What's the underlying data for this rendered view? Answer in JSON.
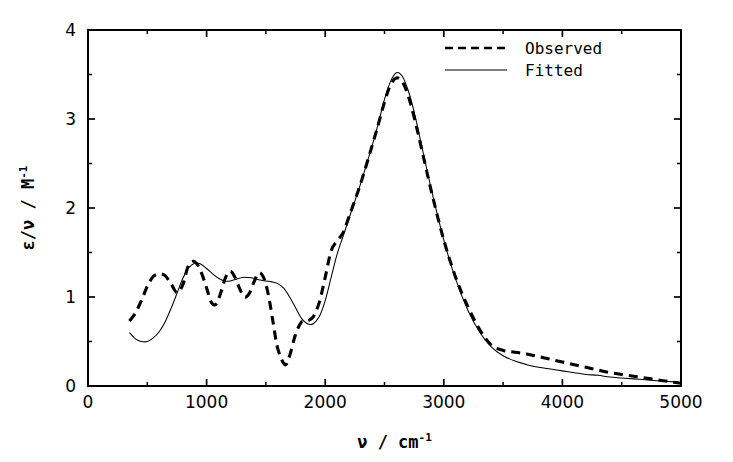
{
  "chart_data": {
    "type": "line",
    "title": "",
    "xlabel": "ν / cm⁻¹",
    "xlabel_parts": {
      "symbol": "ν",
      "separator": "/",
      "unit": "cm",
      "unit_exponent": "-1"
    },
    "ylabel": "ε/ν / M⁻¹",
    "ylabel_parts": {
      "symbol": "ε/ν",
      "separator": "/",
      "unit": "M",
      "unit_exponent": "-1"
    },
    "xlim": [
      0,
      5000
    ],
    "ylim": [
      0,
      4
    ],
    "xticks": [
      0,
      1000,
      2000,
      3000,
      4000,
      5000
    ],
    "xticklabels": [
      "0",
      "1000",
      "2000",
      "3000",
      "4000",
      "5000"
    ],
    "xminorticks": [
      500,
      1500,
      2500,
      3500,
      4500
    ],
    "yticks": [
      0,
      1,
      2,
      3,
      4
    ],
    "yticklabels": [
      "0",
      "1",
      "2",
      "3",
      "4"
    ],
    "yminorticks": [
      0.5,
      1.5,
      2.5,
      3.5
    ],
    "grid": false,
    "legend_position": "top-right",
    "legend": [
      {
        "name": "Observed",
        "style": "dashed",
        "width": "thick"
      },
      {
        "name": "Fitted",
        "style": "solid",
        "width": "thin"
      }
    ],
    "series": [
      {
        "name": "Observed",
        "style": "dashed",
        "x": [
          350,
          400,
          450,
          500,
          550,
          600,
          650,
          700,
          750,
          800,
          840,
          880,
          920,
          960,
          1000,
          1040,
          1080,
          1120,
          1160,
          1200,
          1240,
          1280,
          1320,
          1360,
          1400,
          1440,
          1480,
          1520,
          1560,
          1600,
          1660,
          1700,
          1750,
          1800,
          1850,
          1900,
          1950,
          2000,
          2050,
          2100,
          2150,
          2200,
          2300,
          2400,
          2450,
          2500,
          2550,
          2600,
          2650,
          2700,
          2750,
          2800,
          2900,
          3000,
          3100,
          3200,
          3300,
          3400,
          3500,
          3600,
          3700,
          3800,
          3900,
          4000,
          4100,
          4200,
          4300,
          4400,
          4500,
          4600,
          4700,
          4800,
          4900,
          5000
        ],
        "y": [
          0.73,
          0.82,
          0.96,
          1.12,
          1.23,
          1.26,
          1.24,
          1.15,
          1.05,
          1.14,
          1.33,
          1.4,
          1.37,
          1.26,
          1.1,
          0.94,
          0.92,
          1.05,
          1.22,
          1.29,
          1.22,
          1.09,
          1.0,
          1.04,
          1.17,
          1.27,
          1.22,
          1.03,
          0.72,
          0.42,
          0.24,
          0.34,
          0.58,
          0.72,
          0.73,
          0.78,
          0.94,
          1.22,
          1.52,
          1.63,
          1.72,
          1.9,
          2.28,
          2.72,
          2.95,
          3.19,
          3.38,
          3.46,
          3.42,
          3.26,
          3.02,
          2.74,
          2.16,
          1.64,
          1.22,
          0.9,
          0.64,
          0.46,
          0.4,
          0.38,
          0.36,
          0.33,
          0.3,
          0.27,
          0.24,
          0.21,
          0.18,
          0.15,
          0.13,
          0.11,
          0.09,
          0.07,
          0.05,
          0.03
        ]
      },
      {
        "name": "Fitted",
        "style": "solid",
        "x": [
          350,
          400,
          450,
          500,
          550,
          600,
          650,
          700,
          750,
          800,
          850,
          900,
          950,
          1000,
          1050,
          1100,
          1150,
          1200,
          1250,
          1300,
          1350,
          1400,
          1450,
          1500,
          1550,
          1600,
          1650,
          1700,
          1750,
          1800,
          1850,
          1900,
          1950,
          2000,
          2050,
          2100,
          2150,
          2200,
          2300,
          2400,
          2450,
          2500,
          2550,
          2600,
          2650,
          2700,
          2750,
          2800,
          2900,
          3000,
          3100,
          3200,
          3300,
          3400,
          3500,
          3600,
          3700,
          3800,
          3900,
          4000,
          4100,
          4200,
          4300,
          4400,
          4500,
          4600,
          4700,
          4800,
          4900,
          5000
        ],
        "y": [
          0.6,
          0.53,
          0.5,
          0.5,
          0.54,
          0.61,
          0.72,
          0.87,
          1.04,
          1.21,
          1.33,
          1.38,
          1.37,
          1.32,
          1.26,
          1.21,
          1.18,
          1.18,
          1.2,
          1.22,
          1.22,
          1.21,
          1.19,
          1.18,
          1.17,
          1.15,
          1.1,
          1.0,
          0.88,
          0.76,
          0.7,
          0.7,
          0.78,
          0.96,
          1.22,
          1.48,
          1.68,
          1.88,
          2.28,
          2.72,
          2.96,
          3.22,
          3.42,
          3.52,
          3.48,
          3.32,
          3.08,
          2.78,
          2.18,
          1.64,
          1.2,
          0.86,
          0.61,
          0.44,
          0.34,
          0.28,
          0.24,
          0.21,
          0.19,
          0.17,
          0.15,
          0.13,
          0.12,
          0.1,
          0.09,
          0.08,
          0.07,
          0.06,
          0.05,
          0.04
        ]
      }
    ]
  }
}
